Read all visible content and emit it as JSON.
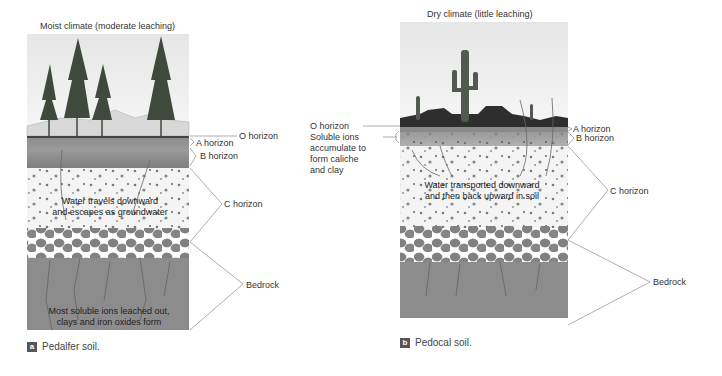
{
  "panel_a": {
    "title": "Moist climate (moderate leaching)",
    "labels": {
      "o_horizon": "O horizon",
      "a_horizon": "A horizon",
      "b_horizon": "B horizon",
      "c_horizon": "C horizon",
      "bedrock": "Bedrock"
    },
    "inner_text_1": [
      "Water travels downward",
      "and escapes as groundwater"
    ],
    "inner_text_2": [
      "Most soluble ions leached out,",
      "clays and iron oxides form"
    ],
    "caption_badge": "a",
    "caption": "Pedalfer soil."
  },
  "panel_b": {
    "title": "Dry climate (little leaching)",
    "labels": {
      "o_horizon": "O horizon",
      "soluble_ions": [
        "Soluble ions",
        "accumulate to",
        "form caliche",
        "and clay"
      ],
      "a_horizon": "A horizon",
      "b_horizon": "B horizon",
      "c_horizon": "C horizon",
      "bedrock": "Bedrock"
    },
    "inner_text": [
      "Water transported downward",
      "and then back upward in soil"
    ],
    "caption_badge": "b",
    "caption": "Pedocal soil."
  },
  "colors": {
    "sky": "#e8e8e8",
    "soil_a": "#8a8a8a",
    "soil_b": "#7a7a7a",
    "c_horizon": "#f2f2f2",
    "rock": "#7d7d7d",
    "bedrock": "#8c8c8c",
    "line": "#777777"
  }
}
